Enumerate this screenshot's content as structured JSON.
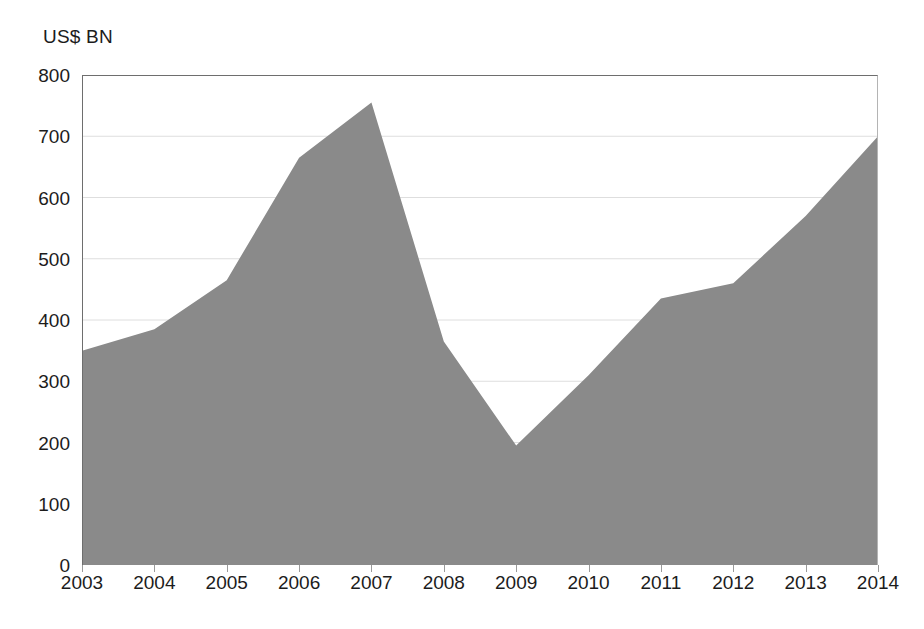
{
  "chart_data": {
    "type": "area",
    "title": "",
    "unit_caption": "US$ BN",
    "xlabel": "",
    "ylabel": "US$ BN",
    "categories": [
      "2003",
      "2004",
      "2005",
      "2006",
      "2007",
      "2008",
      "2009",
      "2010",
      "2011",
      "2012",
      "2013",
      "2014"
    ],
    "values": [
      350,
      385,
      465,
      665,
      755,
      365,
      195,
      310,
      435,
      460,
      570,
      700
    ],
    "series": [
      {
        "name": "US$ BN",
        "values": [
          350,
          385,
          465,
          665,
          755,
          365,
          195,
          310,
          435,
          460,
          570,
          700
        ]
      }
    ],
    "ylim": [
      0,
      800
    ],
    "ytick_values": [
      800,
      700,
      600,
      500,
      400,
      300,
      200,
      100,
      0
    ],
    "ytick_labels": [
      "800",
      "700",
      "600",
      "500",
      "400",
      "300",
      "200",
      "100",
      "0"
    ],
    "xtick_labels": [
      "2003",
      "2004",
      "2005",
      "2006",
      "2007",
      "2008",
      "2009",
      "2010",
      "2011",
      "2012",
      "2013",
      "2014"
    ],
    "grid": true,
    "legend": "none",
    "annotations": [],
    "colors": {
      "area_fill": "#8a8a8a",
      "axis_line": "#6e6e6e",
      "grid_line": "#dedede",
      "text": "#1c1c1c",
      "background": "#ffffff"
    }
  }
}
